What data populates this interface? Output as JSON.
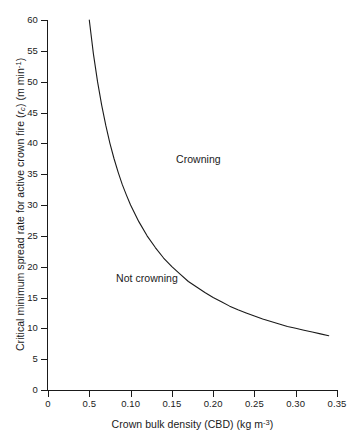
{
  "chart_data": {
    "type": "line",
    "title": "",
    "subtitle": "",
    "xlabel_text": "Crown bulk density (CBD) (kg m",
    "xlabel_sup": "-3",
    "xlabel_tail": ")",
    "ylabel_text": "Critical minimum spread rate for active crown fire (",
    "ylabel_var": "r",
    "ylabel_var_sub": "c",
    "ylabel_mid": ") (m min",
    "ylabel_sup": "-1",
    "ylabel_tail": ")",
    "xlim": [
      0,
      0.35
    ],
    "ylim": [
      0,
      60
    ],
    "grid": false,
    "legend": "none",
    "xticks": [
      0,
      0.05,
      0.1,
      0.15,
      0.2,
      0.25,
      0.3,
      0.35
    ],
    "xticklabels": [
      "0",
      "0.5",
      "0.10",
      "0.15",
      "0.20",
      "0.25",
      "0.30",
      "0.35"
    ],
    "yticks": [
      0,
      5,
      10,
      15,
      20,
      25,
      30,
      35,
      40,
      45,
      50,
      55,
      60
    ],
    "yticklabels": [
      "0",
      "5",
      "10",
      "15",
      "20",
      "25",
      "30",
      "35",
      "40",
      "45",
      "50",
      "55",
      "60"
    ],
    "relation": "r_c = 3.0 / CBD",
    "line_color": "#1a1a1a",
    "background_color": "#ffffff",
    "series": [
      {
        "name": "Critical minimum spread rate",
        "x": [
          0.05,
          0.055,
          0.06,
          0.065,
          0.07,
          0.075,
          0.08,
          0.085,
          0.09,
          0.095,
          0.1,
          0.11,
          0.12,
          0.13,
          0.14,
          0.15,
          0.16,
          0.17,
          0.18,
          0.19,
          0.2,
          0.21,
          0.22,
          0.23,
          0.24,
          0.25,
          0.26,
          0.27,
          0.28,
          0.29,
          0.3,
          0.31,
          0.32,
          0.33,
          0.34
        ],
        "y": [
          60.0,
          54.5,
          50.0,
          46.2,
          42.9,
          40.0,
          37.5,
          35.3,
          33.3,
          31.6,
          30.0,
          27.3,
          25.0,
          23.1,
          21.4,
          20.0,
          18.8,
          17.6,
          16.7,
          15.8,
          15.0,
          14.3,
          13.6,
          13.0,
          12.5,
          12.0,
          11.5,
          11.1,
          10.7,
          10.3,
          10.0,
          9.7,
          9.4,
          9.1,
          8.8
        ]
      }
    ],
    "annotations": [
      {
        "text": "Crowning",
        "x": 0.097,
        "y": 41.5
      },
      {
        "text": "Not crowning",
        "x": 0.024,
        "y": 22.5
      }
    ]
  }
}
